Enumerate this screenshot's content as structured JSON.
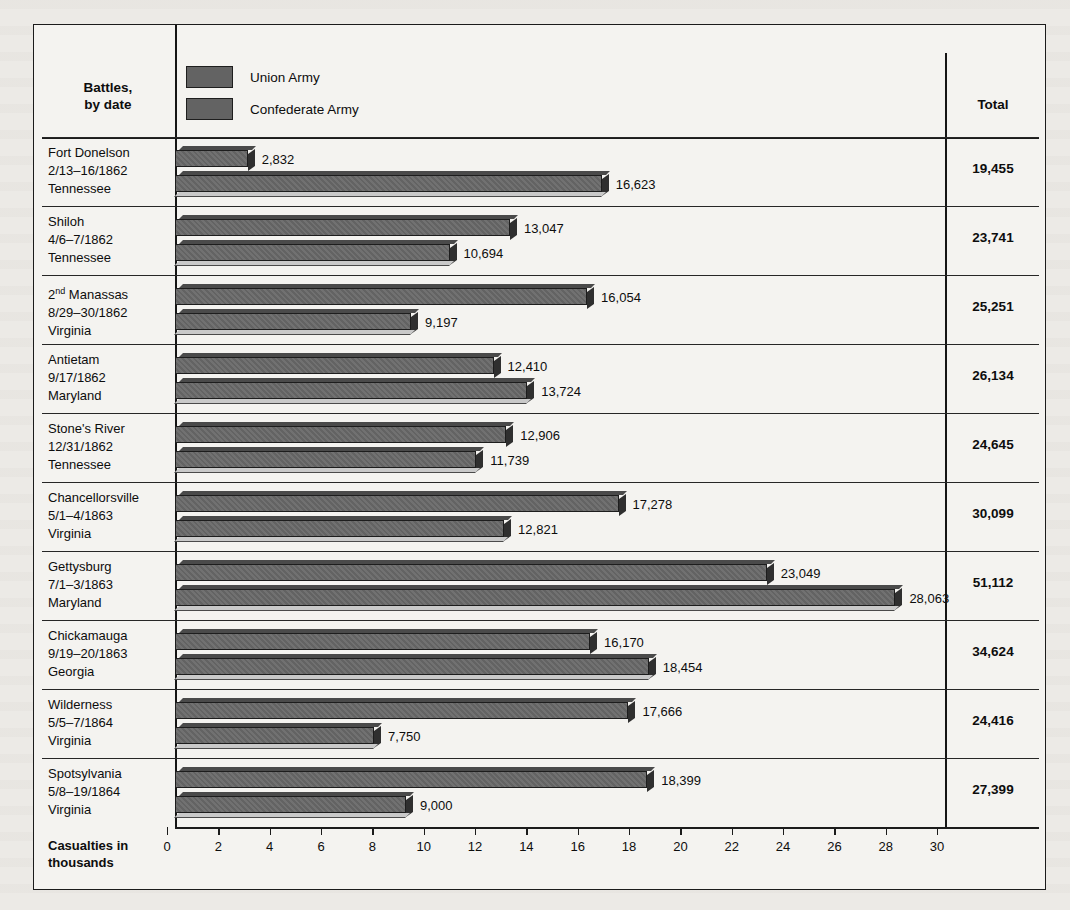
{
  "figure": {
    "header": {
      "battles_label": "Battles,\nby date",
      "battles_line1": "Battles,",
      "battles_line2": "by date",
      "total_label": "Total"
    },
    "legend": [
      {
        "name": "union-army",
        "label": "Union Army",
        "color": "#636363"
      },
      {
        "name": "confederate-army",
        "label": "Confederate Army",
        "color": "#636363"
      }
    ],
    "axis_caption_line1": "Casualties in",
    "axis_caption_line2": "thousands"
  },
  "chart_data": {
    "type": "bar",
    "orientation": "horizontal",
    "title": "",
    "xlabel": "Casualties in thousands",
    "ylabel": "Battles, by date",
    "xlim": [
      0,
      30
    ],
    "xticks": [
      0,
      2,
      4,
      6,
      8,
      10,
      12,
      14,
      16,
      18,
      20,
      22,
      24,
      26,
      28,
      30
    ],
    "grid": false,
    "legend_position": "top-left",
    "series": [
      {
        "name": "Union Army",
        "values": [
          2832,
          13047,
          16054,
          12410,
          12906,
          17278,
          23049,
          16170,
          17666,
          18399
        ]
      },
      {
        "name": "Confederate Army",
        "values": [
          16623,
          10694,
          9197,
          13724,
          11739,
          12821,
          28063,
          18454,
          7750,
          9000
        ]
      }
    ],
    "categories": [
      "Fort Donelson 2/13-16/1862 Tennessee",
      "Shiloh 4/6-7/1862 Tennessee",
      "2nd Manassas 8/29-30/1862 Virginia",
      "Antietam 9/17/1862 Maryland",
      "Stone's River 12/31/1862 Tennessee",
      "Chancellorsville 5/1-4/1863 Virginia",
      "Gettysburg 7/1-3/1863 Maryland",
      "Chickamauga 9/19-20/1863 Georgia",
      "Wilderness 5/5-7/1864 Virginia",
      "Spotsylvania 5/8-19/1864 Virginia"
    ],
    "totals": [
      19455,
      23741,
      25251,
      26134,
      24645,
      30099,
      51112,
      34624,
      24416,
      27399
    ]
  },
  "rows": [
    {
      "battle": "Fort Donelson",
      "date": "2/13–16/1862",
      "state": "Tennessee",
      "sup": "",
      "union": 2832,
      "union_label": "2,832",
      "conf": 16623,
      "conf_label": "16,623",
      "total": "19,455"
    },
    {
      "battle": "Shiloh",
      "date": "4/6–7/1862",
      "state": "Tennessee",
      "sup": "",
      "union": 13047,
      "union_label": "13,047",
      "conf": 10694,
      "conf_label": "10,694",
      "total": "23,741"
    },
    {
      "battle": "Manassas",
      "date": "8/29–30/1862",
      "state": "Virginia",
      "sup": "nd",
      "prefix": "2",
      "union": 16054,
      "union_label": "16,054",
      "conf": 9197,
      "conf_label": "9,197",
      "total": "25,251"
    },
    {
      "battle": "Antietam",
      "date": "9/17/1862",
      "state": "Maryland",
      "sup": "",
      "union": 12410,
      "union_label": "12,410",
      "conf": 13724,
      "conf_label": "13,724",
      "total": "26,134"
    },
    {
      "battle": "Stone's River",
      "date": "12/31/1862",
      "state": "Tennessee",
      "sup": "",
      "union": 12906,
      "union_label": "12,906",
      "conf": 11739,
      "conf_label": "11,739",
      "total": "24,645"
    },
    {
      "battle": "Chancellorsville",
      "date": "5/1–4/1863",
      "state": "Virginia",
      "sup": "",
      "union": 17278,
      "union_label": "17,278",
      "conf": 12821,
      "conf_label": "12,821",
      "total": "30,099"
    },
    {
      "battle": "Gettysburg",
      "date": "7/1–3/1863",
      "state": "Maryland",
      "sup": "",
      "union": 23049,
      "union_label": "23,049",
      "conf": 28063,
      "conf_label": "28,063",
      "total": "51,112"
    },
    {
      "battle": "Chickamauga",
      "date": "9/19–20/1863",
      "state": "Georgia",
      "sup": "",
      "union": 16170,
      "union_label": "16,170",
      "conf": 18454,
      "conf_label": "18,454",
      "total": "34,624"
    },
    {
      "battle": "Wilderness",
      "date": "5/5–7/1864",
      "state": "Virginia",
      "sup": "",
      "union": 17666,
      "union_label": "17,666",
      "conf": 7750,
      "conf_label": "7,750",
      "total": "24,416"
    },
    {
      "battle": "Spotsylvania",
      "date": "5/8–19/1864",
      "state": "Virginia",
      "sup": "",
      "union": 18399,
      "union_label": "18,399",
      "conf": 9000,
      "conf_label": "9,000",
      "total": "27,399"
    }
  ]
}
